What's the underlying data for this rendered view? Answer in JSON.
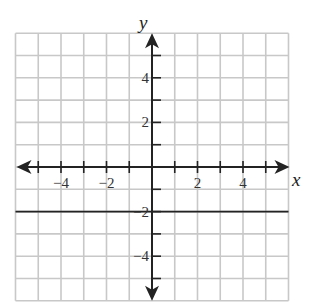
{
  "chart_data": {
    "type": "line",
    "title": "",
    "xlabel": "x",
    "ylabel": "y",
    "xlim": [
      -6,
      6
    ],
    "ylim": [
      -6,
      6
    ],
    "grid": true,
    "x_ticks": [
      -5,
      -4,
      -3,
      -2,
      -1,
      1,
      2,
      3,
      4,
      5
    ],
    "y_ticks": [
      -5,
      -4,
      -3,
      -2,
      -1,
      1,
      2,
      3,
      4,
      5
    ],
    "x_tick_labels": [
      {
        "value": -4,
        "label": "−4"
      },
      {
        "value": -2,
        "label": "−2"
      },
      {
        "value": 2,
        "label": "2"
      },
      {
        "value": 4,
        "label": "4"
      }
    ],
    "y_tick_labels": [
      {
        "value": 4,
        "label": "4"
      },
      {
        "value": 2,
        "label": "2"
      },
      {
        "value": -2,
        "label": "−2"
      },
      {
        "value": -4,
        "label": "−4"
      }
    ],
    "series": [
      {
        "name": "y = -2",
        "equation": "y = -2",
        "x": [
          -6,
          6
        ],
        "y": [
          -2,
          -2
        ]
      }
    ],
    "legend": null
  },
  "colors": {
    "grid": "#c8c8c8",
    "axis": "#232323",
    "line": "#232323",
    "background": "#ffffff"
  }
}
